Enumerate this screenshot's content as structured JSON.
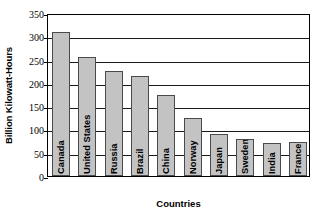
{
  "chart_data": {
    "type": "bar",
    "title": "",
    "xlabel": "Countries",
    "ylabel": "Billion Kilowatt-Hours",
    "categories": [
      "Canada",
      "United States",
      "Russia",
      "Brazil",
      "China",
      "Norway",
      "Japan",
      "Sweden",
      "India",
      "France"
    ],
    "values": [
      310,
      255,
      225,
      215,
      175,
      125,
      90,
      80,
      70,
      72
    ],
    "ylim": [
      0,
      350
    ],
    "ytick_labels": [
      "0",
      "50",
      "100",
      "150",
      "200",
      "250",
      "300",
      "350"
    ],
    "ytick_values": [
      0,
      50,
      100,
      150,
      200,
      250,
      300,
      350
    ],
    "grid": "horizontal",
    "legend": "none",
    "bar_fill_color": "#c3c3c3",
    "bar_border_color": "#4a4a4a",
    "axis_color": "#000000"
  }
}
